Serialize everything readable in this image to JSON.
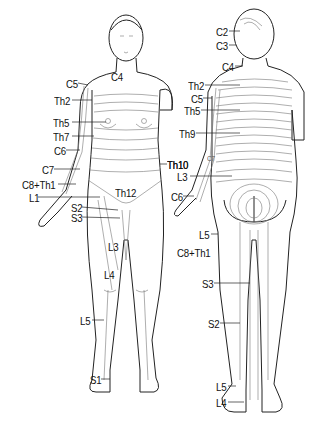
{
  "diagram": {
    "type": "dermatome-map",
    "views": [
      "front",
      "back"
    ],
    "front_labels": [
      {
        "id": "c4",
        "text": "C4",
        "x": 111,
        "y": 72
      },
      {
        "id": "c5",
        "text": "C5",
        "x": 66,
        "y": 79
      },
      {
        "id": "th2",
        "text": "Th2",
        "x": 54,
        "y": 96
      },
      {
        "id": "th5",
        "text": "Th5",
        "x": 53,
        "y": 118
      },
      {
        "id": "th7",
        "text": "Th7",
        "x": 53,
        "y": 132
      },
      {
        "id": "c6",
        "text": "C6",
        "x": 54,
        "y": 146
      },
      {
        "id": "c7",
        "text": "C7",
        "x": 42,
        "y": 165
      },
      {
        "id": "th10",
        "text": "Th10",
        "x": 167,
        "y": 160
      },
      {
        "id": "c8th1",
        "text": "C8+Th1",
        "x": 22,
        "y": 180
      },
      {
        "id": "l1",
        "text": "L1",
        "x": 29,
        "y": 193
      },
      {
        "id": "th12",
        "text": "Th12",
        "x": 115,
        "y": 188
      },
      {
        "id": "s2",
        "text": "S2",
        "x": 71,
        "y": 203
      },
      {
        "id": "s3",
        "text": "S3",
        "x": 71,
        "y": 213
      },
      {
        "id": "l3",
        "text": "L3",
        "x": 108,
        "y": 242
      },
      {
        "id": "l4",
        "text": "L4",
        "x": 104,
        "y": 270
      },
      {
        "id": "l5",
        "text": "L5",
        "x": 80,
        "y": 316
      },
      {
        "id": "s1",
        "text": "S1",
        "x": 90,
        "y": 375
      }
    ],
    "back_labels": [
      {
        "id": "c2",
        "text": "C2",
        "x": 216,
        "y": 27
      },
      {
        "id": "c3",
        "text": "C3",
        "x": 216,
        "y": 41
      },
      {
        "id": "c4b",
        "text": "C4",
        "x": 222,
        "y": 62
      },
      {
        "id": "th2b",
        "text": "Th2",
        "x": 188,
        "y": 81
      },
      {
        "id": "c5b",
        "text": "C5",
        "x": 191,
        "y": 94
      },
      {
        "id": "th5b",
        "text": "Th5",
        "x": 184,
        "y": 106
      },
      {
        "id": "th9",
        "text": "Th9",
        "x": 179,
        "y": 129
      },
      {
        "id": "th10b",
        "text": "Th10",
        "x": 167,
        "y": 160
      },
      {
        "id": "c7b",
        "text": "C7",
        "x": 207,
        "y": 155,
        "small": true
      },
      {
        "id": "l3b",
        "text": "L3",
        "x": 177,
        "y": 172
      },
      {
        "id": "c6b",
        "text": "C6",
        "x": 171,
        "y": 192
      },
      {
        "id": "l5b",
        "text": "L5",
        "x": 199,
        "y": 230
      },
      {
        "id": "c8th1b",
        "text": "C8+Th1",
        "x": 177,
        "y": 248
      },
      {
        "id": "s3b",
        "text": "S3",
        "x": 202,
        "y": 279
      },
      {
        "id": "s2b",
        "text": "S2",
        "x": 208,
        "y": 319
      },
      {
        "id": "l5c",
        "text": "L5",
        "x": 216,
        "y": 382
      },
      {
        "id": "l4b",
        "text": "L4",
        "x": 216,
        "y": 398
      }
    ]
  }
}
